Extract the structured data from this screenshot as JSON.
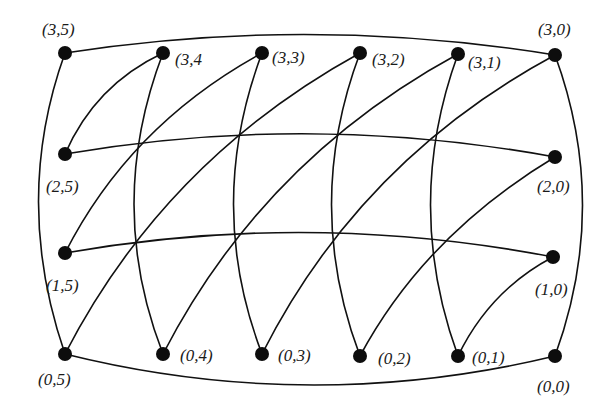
{
  "diagram": {
    "type": "graph",
    "colors": {
      "edge": "#111111",
      "node": "#0d0d0d",
      "label": "#1a1a1a",
      "background": "#ffffff"
    },
    "nodes": [
      {
        "id": "3,5",
        "label": "(3,5)",
        "x": 65,
        "y": 53,
        "lx": 42,
        "ly": 35
      },
      {
        "id": "3,4",
        "label": "(3,4",
        "x": 163,
        "y": 53,
        "lx": 175,
        "ly": 65
      },
      {
        "id": "3,3",
        "label": "(3,3)",
        "x": 262,
        "y": 53,
        "lx": 272,
        "ly": 63
      },
      {
        "id": "3,2",
        "label": "(3,2)",
        "x": 360,
        "y": 53,
        "lx": 372,
        "ly": 65
      },
      {
        "id": "3,1",
        "label": "(3,1)",
        "x": 458,
        "y": 54,
        "lx": 468,
        "ly": 68
      },
      {
        "id": "3,0",
        "label": "(3,0)",
        "x": 555,
        "y": 55,
        "lx": 538,
        "ly": 35
      },
      {
        "id": "2,5",
        "label": "(2,5)",
        "x": 65,
        "y": 154,
        "lx": 46,
        "ly": 192
      },
      {
        "id": "2,0",
        "label": "(2,0)",
        "x": 555,
        "y": 157,
        "lx": 537,
        "ly": 192
      },
      {
        "id": "1,5",
        "label": "(1,5)",
        "x": 65,
        "y": 253,
        "lx": 46,
        "ly": 291
      },
      {
        "id": "1,0",
        "label": "(1,0)",
        "x": 553,
        "y": 257,
        "lx": 535,
        "ly": 295
      },
      {
        "id": "0,5",
        "label": "(0,5)",
        "x": 65,
        "y": 354,
        "lx": 38,
        "ly": 385
      },
      {
        "id": "0,4",
        "label": "(0,4)",
        "x": 163,
        "y": 354,
        "lx": 180,
        "ly": 361
      },
      {
        "id": "0,3",
        "label": "(0,3)",
        "x": 262,
        "y": 354,
        "lx": 278,
        "ly": 361
      },
      {
        "id": "0,2",
        "label": "(0,2)",
        "x": 360,
        "y": 356,
        "lx": 378,
        "ly": 364
      },
      {
        "id": "0,1",
        "label": "(0,1)",
        "x": 458,
        "y": 356,
        "lx": 472,
        "ly": 363
      },
      {
        "id": "0,0",
        "label": "(0,0)",
        "x": 555,
        "y": 356,
        "lx": 537,
        "ly": 392
      }
    ],
    "edges": [
      {
        "from": "3,5",
        "to": "3,0",
        "path": "M65,53 Q310,15 555,55"
      },
      {
        "from": "0,5",
        "to": "0,0",
        "path": "M65,354 Q310,415 555,356"
      },
      {
        "from": "3,5",
        "to": "0,5",
        "path": "M65,53 Q12,200 65,354"
      },
      {
        "from": "3,0",
        "to": "0,0",
        "path": "M555,55 Q610,205 555,356"
      },
      {
        "from": "2,5",
        "to": "2,0",
        "path": "M65,154 Q310,112 555,157"
      },
      {
        "from": "1,5",
        "to": "1,0",
        "path": "M65,253 Q310,210 553,257"
      },
      {
        "from": "3,4",
        "to": "0,4",
        "path": "M163,53 Q105,205 163,354"
      },
      {
        "from": "3,3",
        "to": "0,3",
        "path": "M262,53 Q205,205 262,354"
      },
      {
        "from": "3,2",
        "to": "0,2",
        "path": "M360,53 Q303,205 360,356"
      },
      {
        "from": "3,1",
        "to": "0,1",
        "path": "M458,54 Q403,205 458,356"
      },
      {
        "from": "3,4",
        "to": "2,5",
        "path": "M163,53 Q95,85 65,154"
      },
      {
        "from": "3,3",
        "to": "1,5",
        "path": "M262,53 Q130,125 65,253"
      },
      {
        "from": "3,2",
        "to": "0,5",
        "path": "M360,53 Q165,160 65,354"
      },
      {
        "from": "3,1",
        "to": "0,4",
        "path": "M458,54 Q263,160 163,354"
      },
      {
        "from": "3,0",
        "to": "0,3",
        "path": "M555,55 Q360,160 262,354"
      },
      {
        "from": "2,0",
        "to": "0,2",
        "path": "M555,157 Q425,235 360,356"
      },
      {
        "from": "1,0",
        "to": "0,1",
        "path": "M553,257 Q490,290 458,356"
      }
    ],
    "node_radius": 7
  }
}
